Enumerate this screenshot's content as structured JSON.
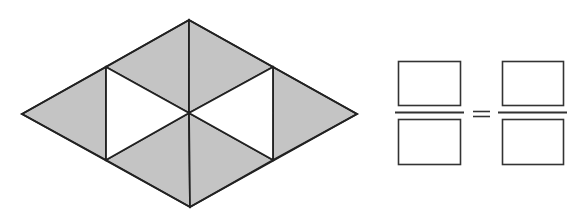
{
  "figure": {
    "colors": {
      "shaded_fill": "#c4c4c4",
      "unshaded_fill": "#ffffff",
      "stroke": "#222222",
      "background": "#ffffff"
    },
    "rhombus": {
      "vertices": {
        "left": [
          22,
          114
        ],
        "top": [
          189,
          20
        ],
        "right": [
          357,
          114
        ],
        "bottom": [
          190,
          207
        ]
      },
      "inner_points": {
        "upper_left": [
          106,
          67
        ],
        "upper_right": [
          273,
          67
        ],
        "lower_left": [
          106,
          160
        ],
        "lower_right": [
          273,
          160
        ],
        "center": [
          189,
          113
        ]
      },
      "triangles": [
        {
          "name": "far-left-triangle",
          "shaded": true
        },
        {
          "name": "upper-left-triangle",
          "shaded": true
        },
        {
          "name": "upper-right-triangle",
          "shaded": true
        },
        {
          "name": "far-right-triangle",
          "shaded": true
        },
        {
          "name": "lower-left-triangle",
          "shaded": true
        },
        {
          "name": "lower-right-triangle",
          "shaded": true
        },
        {
          "name": "left-inner-triangle",
          "shaded": false
        },
        {
          "name": "right-inner-triangle",
          "shaded": false
        }
      ],
      "shaded_count": 6,
      "total_count": 8
    },
    "equation": {
      "operator": "=",
      "left_fraction": {
        "numerator_box": "",
        "denominator_box": ""
      },
      "right_fraction": {
        "numerator_box": "",
        "denominator_box": ""
      }
    }
  }
}
